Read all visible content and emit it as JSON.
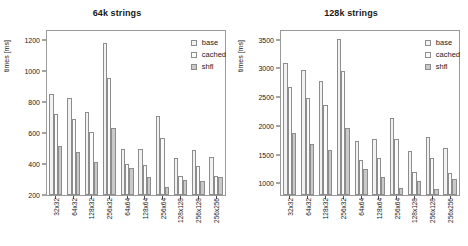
{
  "figure": {
    "panels": [
      "left",
      "right"
    ]
  },
  "legend": {
    "position": "top-right",
    "entries": [
      {
        "label": "base",
        "swatch": "base",
        "color": "#f2f2f2"
      },
      {
        "label": "cached",
        "swatch": "cached",
        "color": "#fbfbfb"
      },
      {
        "label": "shfl",
        "swatch": "shfl",
        "color": "#c9c9c9"
      }
    ]
  },
  "chart_data": [
    {
      "type": "bar",
      "title": "64k strings",
      "xlabel": "",
      "ylabel": "times [ms]",
      "ylim": [
        200,
        1260
      ],
      "yticks": [
        200,
        400,
        600,
        800,
        1000,
        1200
      ],
      "ytick_labels": [
        "200",
        "400",
        "600",
        "800",
        "1000",
        "1200"
      ],
      "grid": false,
      "legend_position": "upper right",
      "categories": [
        "32x32",
        "64x32",
        "128x32",
        "256x32",
        "64x64",
        "128x64",
        "256x64",
        "128x128",
        "256x128",
        "256x256"
      ],
      "series": [
        {
          "name": "base",
          "values": [
            850,
            830,
            735,
            1180,
            500,
            500,
            710,
            440,
            490,
            445
          ]
        },
        {
          "name": "cached",
          "values": [
            722,
            690,
            605,
            955,
            400,
            395,
            570,
            325,
            388,
            325
          ]
        },
        {
          "name": "shfl",
          "values": [
            515,
            475,
            415,
            630,
            372,
            315,
            255,
            300,
            293,
            315
          ]
        }
      ]
    },
    {
      "type": "bar",
      "title": "128k strings",
      "xlabel": "",
      "ylabel": "times [ms]",
      "ylim": [
        800,
        3650
      ],
      "yticks": [
        1000,
        1500,
        2000,
        2500,
        3000,
        3500
      ],
      "ytick_labels": [
        "1000",
        "1500",
        "2000",
        "2500",
        "3000",
        "3500"
      ],
      "grid": false,
      "legend_position": "upper right",
      "categories": [
        "32x32",
        "64x32",
        "128x32",
        "256x32",
        "64x64",
        "128x64",
        "256x64",
        "128x128",
        "256x128",
        "256x256"
      ],
      "series": [
        {
          "name": "base",
          "values": [
            3100,
            2970,
            2780,
            3510,
            1730,
            1780,
            2140,
            1560,
            1800,
            1610
          ]
        },
        {
          "name": "cached",
          "values": [
            2670,
            2490,
            2360,
            2960,
            1410,
            1450,
            1770,
            1200,
            1440,
            1180
          ]
        },
        {
          "name": "shfl",
          "values": [
            1870,
            1690,
            1580,
            1970,
            1260,
            1120,
            930,
            1050,
            900,
            1085
          ]
        }
      ]
    }
  ]
}
